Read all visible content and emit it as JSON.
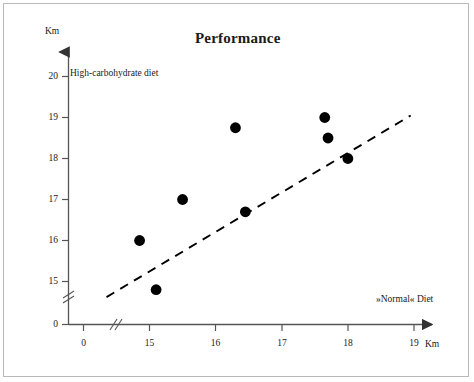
{
  "figure": {
    "title": "Performance",
    "series_label": "High-carbohydrate diet",
    "xaxis_label": "»Normal« Diet",
    "yaxis_unit": "Km",
    "xaxis_unit": "Km"
  },
  "colors": {
    "ink": "#1a1a1a",
    "axis": "#555555",
    "marker": "#000000",
    "trendline": "#000000",
    "page_border": "#b9b9b9",
    "background": "#ffffff"
  },
  "chart_data": {
    "type": "scatter",
    "title": "Performance",
    "xlabel": "»Normal« Diet",
    "ylabel": "High-carbohydrate diet",
    "x_unit": "Km",
    "y_unit": "Km",
    "xlim": [
      14.3,
      19.2
    ],
    "ylim": [
      14.45,
      20.35
    ],
    "x_axis_break": true,
    "y_axis_break": true,
    "grid": false,
    "legend": false,
    "xticks": [
      0,
      15,
      16,
      17,
      18,
      19
    ],
    "xtick_labels": [
      "0",
      "15",
      "16",
      "17",
      "18",
      "19"
    ],
    "yticks": [
      0,
      15,
      16,
      17,
      18,
      19,
      20
    ],
    "ytick_labels": [
      "0",
      "15",
      "16",
      "17",
      "18",
      "19",
      "20"
    ],
    "points": [
      {
        "x": 14.85,
        "y": 16.0
      },
      {
        "x": 15.1,
        "y": 14.8
      },
      {
        "x": 15.5,
        "y": 17.0
      },
      {
        "x": 16.3,
        "y": 18.75
      },
      {
        "x": 16.45,
        "y": 16.7
      },
      {
        "x": 17.65,
        "y": 19.0
      },
      {
        "x": 17.7,
        "y": 18.5
      },
      {
        "x": 18.0,
        "y": 18.0
      }
    ],
    "trendline": {
      "style": "dashed",
      "x0": 14.35,
      "y0": 14.62,
      "x1": 18.95,
      "y1": 19.05
    },
    "annotations": [
      {
        "text": "High-carbohydrate diet",
        "position": "top-left-inside"
      },
      {
        "text": "»Normal« Diet",
        "position": "bottom-right-inside"
      }
    ]
  }
}
